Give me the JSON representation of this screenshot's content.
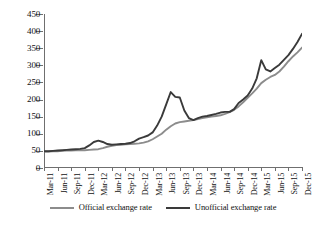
{
  "chart_data": {
    "type": "line",
    "title": "",
    "xlabel": "",
    "ylabel": "",
    "ylim": [
      0,
      450
    ],
    "ytick_step": 50,
    "yticks": [
      0,
      50,
      100,
      150,
      200,
      250,
      300,
      350,
      400,
      450
    ],
    "grid": false,
    "legend_position": "bottom",
    "tick_labels": [
      "Mar-11",
      "Jun-11",
      "Sep-11",
      "Dec-11",
      "Mar-12",
      "Jun-12",
      "Sep-12",
      "Dec-12",
      "Mar-13",
      "Jun-13",
      "Sep-13",
      "Dec-13",
      "Mar-14",
      "Jun-14",
      "Sep-14",
      "Dec-14",
      "Mar-15",
      "Jun-15",
      "Sep-15",
      "Dec-15"
    ],
    "x": [
      "Mar-11",
      "Apr-11",
      "May-11",
      "Jun-11",
      "Jul-11",
      "Aug-11",
      "Sep-11",
      "Oct-11",
      "Nov-11",
      "Dec-11",
      "Jan-12",
      "Feb-12",
      "Mar-12",
      "Apr-12",
      "May-12",
      "Jun-12",
      "Jul-12",
      "Aug-12",
      "Sep-12",
      "Oct-12",
      "Nov-12",
      "Dec-12",
      "Jan-13",
      "Feb-13",
      "Mar-13",
      "Apr-13",
      "May-13",
      "Jun-13",
      "Jul-13",
      "Aug-13",
      "Sep-13",
      "Oct-13",
      "Nov-13",
      "Dec-13",
      "Jan-14",
      "Feb-14",
      "Mar-14",
      "Apr-14",
      "May-14",
      "Jun-14",
      "Jul-14",
      "Aug-14",
      "Sep-14",
      "Oct-14",
      "Nov-14",
      "Dec-14",
      "Jan-15",
      "Feb-15",
      "Mar-15",
      "Apr-15",
      "May-15",
      "Jun-15",
      "Jul-15",
      "Aug-15",
      "Sep-15",
      "Oct-15",
      "Nov-15",
      "Dec-15"
    ],
    "series": [
      {
        "name": "Official exchange rate",
        "color": "#8c8c8c",
        "values": [
          48,
          48,
          49,
          49,
          50,
          51,
          51,
          52,
          52,
          52,
          53,
          54,
          55,
          58,
          62,
          65,
          67,
          68,
          69,
          70,
          71,
          72,
          74,
          78,
          84,
          92,
          100,
          112,
          122,
          130,
          134,
          136,
          138,
          140,
          143,
          146,
          148,
          150,
          152,
          154,
          158,
          163,
          170,
          180,
          192,
          205,
          218,
          232,
          248,
          258,
          266,
          272,
          282,
          296,
          312,
          326,
          338,
          352
        ]
      },
      {
        "name": "Unofficial exchange rate",
        "color": "#3a3a3a",
        "values": [
          49,
          49,
          50,
          51,
          52,
          53,
          54,
          55,
          56,
          58,
          66,
          76,
          80,
          76,
          70,
          68,
          69,
          70,
          71,
          73,
          78,
          86,
          90,
          95,
          104,
          124,
          150,
          186,
          222,
          208,
          206,
          168,
          146,
          140,
          146,
          150,
          152,
          155,
          158,
          162,
          164,
          164,
          172,
          190,
          200,
          212,
          232,
          262,
          315,
          288,
          282,
          292,
          302,
          316,
          330,
          348,
          368,
          392
        ]
      }
    ]
  },
  "legend": {
    "items": [
      {
        "label": "Official exchange rate",
        "color": "#8c8c8c"
      },
      {
        "label": "Unofficial exchange rate",
        "color": "#3a3a3a"
      }
    ]
  }
}
